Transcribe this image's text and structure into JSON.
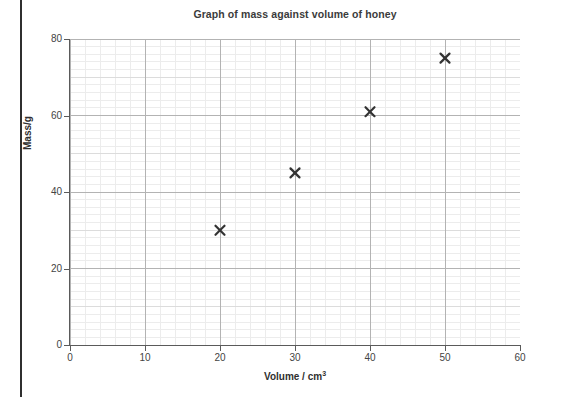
{
  "chart_data": {
    "type": "scatter",
    "title": "Graph of mass against volume of honey",
    "xlabel": "Volume / cm",
    "xlabel_superscript": "3",
    "ylabel": "Mass/g",
    "xlim": [
      0,
      60
    ],
    "ylim": [
      0,
      80
    ],
    "x_ticks": [
      0,
      10,
      20,
      30,
      40,
      50,
      60
    ],
    "y_ticks": [
      0,
      20,
      40,
      60,
      80
    ],
    "x_tick_labels": [
      "0",
      "10",
      "20",
      "30",
      "40",
      "50",
      "60"
    ],
    "y_tick_labels": [
      "0",
      "20",
      "40",
      "60",
      "80"
    ],
    "x_minor_step": 2,
    "y_minor_step": 2,
    "grid": true,
    "legend": "none",
    "marker": "x-cross",
    "marker_color": "#333333",
    "points": [
      {
        "x": 20,
        "y": 30,
        "label": "(20, 30)"
      },
      {
        "x": 30,
        "y": 45,
        "label": "(30, 45)"
      },
      {
        "x": 40,
        "y": 61,
        "label": "(40, 61)"
      },
      {
        "x": 50,
        "y": 75,
        "label": "(50, 75)"
      }
    ],
    "series": [
      {
        "name": "honey mass vs volume",
        "x": [
          20,
          30,
          40,
          50
        ],
        "values": [
          30,
          45,
          61,
          75
        ]
      }
    ]
  },
  "colors": {
    "title_text": "#3b3b3b",
    "axis_line": "#5a5a5a",
    "tick_text": "#444444",
    "grid_minor": "#ececec",
    "grid_medium": "#dcdcdc",
    "grid_major": "#b3b3b3",
    "marker": "#333333",
    "page_edge": "#2f2f2f"
  }
}
